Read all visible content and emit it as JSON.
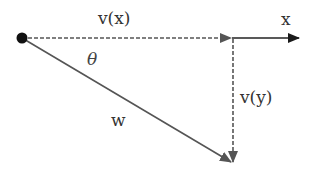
{
  "diagram": {
    "type": "vector-decomposition",
    "labels": {
      "vx": "v(x)",
      "x_axis": "x",
      "theta": "θ",
      "w": "w",
      "vy": "v(y)"
    },
    "colors": {
      "line": "#555555",
      "dashed": "#555555",
      "axis": "#222222",
      "origin": "#111111",
      "text": "#333333"
    },
    "elements": [
      {
        "id": "origin-point",
        "shape": "dot"
      },
      {
        "id": "vx-component",
        "style": "dashed-arrow",
        "direction": "horizontal",
        "label": "v(x)"
      },
      {
        "id": "x-axis",
        "style": "solid-arrow",
        "direction": "horizontal",
        "label": "x"
      },
      {
        "id": "vy-component",
        "style": "dashed-arrow",
        "direction": "vertical-down",
        "label": "v(y)"
      },
      {
        "id": "w-vector",
        "style": "solid-arrow",
        "direction": "diagonal-down-right",
        "label": "w"
      },
      {
        "id": "angle",
        "label": "θ"
      }
    ]
  }
}
